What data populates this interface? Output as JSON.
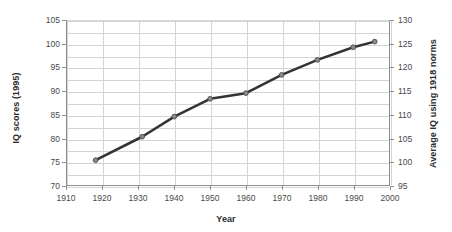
{
  "chart_data": {
    "type": "line",
    "title": "",
    "xlabel": "Year",
    "ylabel": "IQ scores (1995)",
    "ylabel_secondary": "Average IQ using 1918 norms",
    "x": [
      1918,
      1931,
      1940,
      1950,
      1960,
      1970,
      1980,
      1990,
      1996
    ],
    "series": [
      {
        "name": "IQ scores (1995)",
        "values": [
          75.3,
          80.3,
          84.6,
          88.4,
          89.6,
          93.5,
          96.7,
          99.4,
          100.6
        ],
        "color": "#333333"
      }
    ],
    "secondary_values": [
      100.3,
      105.3,
      109.6,
      113.4,
      114.6,
      118.5,
      121.7,
      124.4,
      125.6
    ],
    "xlim": [
      1910,
      2000
    ],
    "ylim": [
      70,
      105
    ],
    "ylim_secondary": [
      95,
      130
    ],
    "xticks": [
      1910,
      1920,
      1930,
      1940,
      1950,
      1960,
      1970,
      1980,
      1990,
      2000
    ],
    "yticks_left": [
      70,
      75,
      80,
      85,
      90,
      95,
      100,
      105
    ],
    "yticks_right": [
      95,
      100,
      105,
      110,
      115,
      120,
      125,
      130
    ],
    "grid": true,
    "minor_grid_y": true,
    "legend": "none",
    "marker": "circle"
  }
}
